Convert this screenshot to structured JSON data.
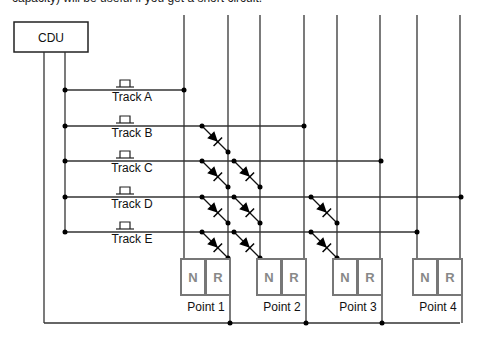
{
  "caption": "capacity) will be useful if you get a short circuit.",
  "cdu": {
    "label": "CDU"
  },
  "tracks": [
    {
      "label": "Track A",
      "y": 90,
      "end_x": 184,
      "diode_cols": []
    },
    {
      "label": "Track B",
      "y": 126,
      "end_x": 304,
      "diode_cols": [
        0
      ]
    },
    {
      "label": "Track C",
      "y": 161,
      "end_x": 381,
      "diode_cols": [
        0,
        1
      ]
    },
    {
      "label": "Track D",
      "y": 197,
      "end_x": 461,
      "diode_cols": [
        0,
        1,
        2
      ]
    },
    {
      "label": "Track E",
      "y": 232,
      "end_x": 417,
      "diode_cols": [
        0,
        1,
        2
      ]
    }
  ],
  "points": [
    {
      "label": "Point 1",
      "n": "N",
      "r": "R"
    },
    {
      "label": "Point 2",
      "n": "N",
      "r": "R"
    },
    {
      "label": "Point 3",
      "n": "N",
      "r": "R"
    },
    {
      "label": "Point 4",
      "n": "N",
      "r": "R"
    }
  ],
  "icons": {
    "pushbutton": "pushbutton-switch-icon",
    "diode": "diode-icon"
  }
}
